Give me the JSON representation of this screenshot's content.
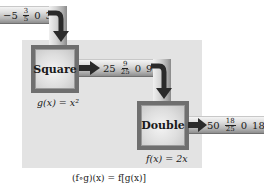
{
  "diagram": {
    "input_tube": {
      "values": [
        "−5",
        {
          "num": "3",
          "den": "5"
        },
        "0",
        "3"
      ]
    },
    "machines": [
      {
        "name": "Square",
        "rule": "g(x) = x²"
      },
      {
        "name": "Double",
        "rule": "f(x) = 2x"
      }
    ],
    "middle_tube": {
      "values": [
        "25",
        {
          "num": "9",
          "den": "25"
        },
        "0",
        "9"
      ]
    },
    "output_tube": {
      "values": [
        "50",
        {
          "num": "18",
          "den": "25"
        },
        "0",
        "18"
      ]
    },
    "composition_formula": "(f∘g)(x) = f[g(x)]"
  },
  "colors": {
    "panel": "#e3e3e3",
    "machine_frame": "#6f6f6f",
    "arrow": "#2a2a2a"
  }
}
